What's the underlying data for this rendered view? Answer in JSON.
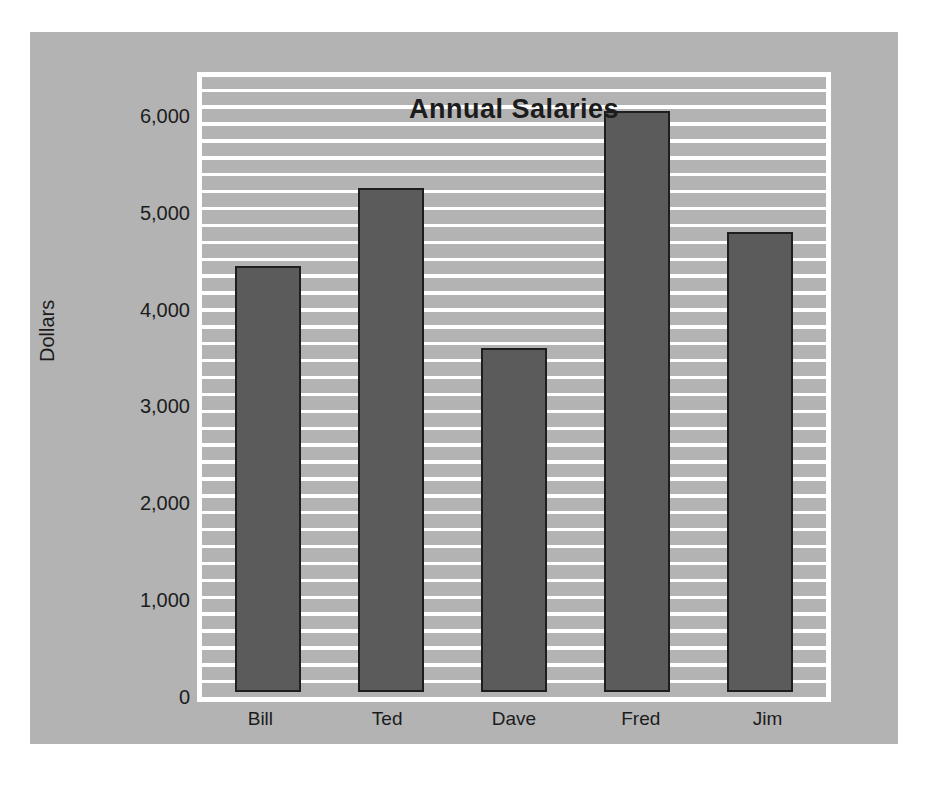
{
  "chart_data": {
    "type": "bar",
    "title": "Annual Salaries",
    "xlabel": "",
    "ylabel": "Dollars",
    "categories": [
      "Bill",
      "Ted",
      "Dave",
      "Fred",
      "Jim"
    ],
    "values": [
      4400,
      5200,
      3550,
      6000,
      4750
    ],
    "ylim": [
      0,
      6400
    ],
    "ytick_labels": [
      "0",
      "1,000",
      "2,000",
      "3,000",
      "4,000",
      "5,000",
      "6,000"
    ],
    "ytick_values": [
      0,
      1000,
      2000,
      3000,
      4000,
      5000,
      6000
    ],
    "minor_gridline_interval": 200,
    "grid": true,
    "grid_orientation": "horizontal",
    "legend": false,
    "legend_position": "none",
    "series": [
      {
        "name": "Annual Salaries",
        "values": [
          4400,
          5200,
          3550,
          6000,
          4750
        ]
      }
    ]
  },
  "colors": {
    "page_background": "#ffffff",
    "panel_background": "#b3b3b3",
    "gridline": "#ffffff",
    "bar_fill": "#5b5b5b",
    "bar_outline": "#1e1e1e",
    "text": "#1c1c1c"
  }
}
